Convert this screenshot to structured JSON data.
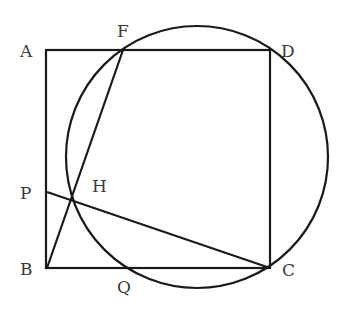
{
  "figure": {
    "type": "geometry",
    "points": {
      "A": {
        "label": "A",
        "x": 46,
        "y": 50,
        "lx": 20,
        "ly": 57
      },
      "B": {
        "label": "B",
        "x": 47,
        "y": 268,
        "lx": 20,
        "ly": 275
      },
      "C": {
        "label": "C",
        "x": 270,
        "y": 268,
        "lx": 282,
        "ly": 276
      },
      "D": {
        "label": "D",
        "x": 270,
        "y": 50,
        "lx": 281,
        "ly": 57
      },
      "F": {
        "label": "F",
        "x": 123,
        "y": 50,
        "lx": 117,
        "ly": 37
      },
      "P": {
        "label": "P",
        "x": 47,
        "y": 192,
        "lx": 20,
        "ly": 199
      },
      "H": {
        "label": "H",
        "x": 72,
        "y": 201,
        "lx": 92,
        "ly": 192
      },
      "Q": {
        "label": "Q",
        "x": 126,
        "y": 268,
        "lx": 117,
        "ly": 293
      }
    },
    "circle": {
      "cx": 197,
      "cy": 157,
      "r": 131
    },
    "stroke_color": "#1a1a1a",
    "label_color": "#3a3a3a"
  }
}
